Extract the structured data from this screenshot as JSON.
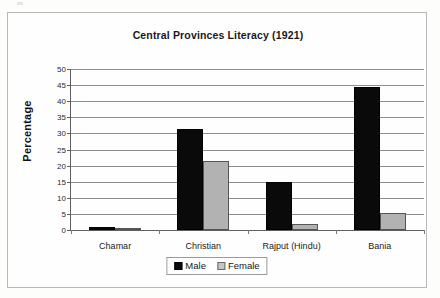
{
  "chart_data": {
    "type": "bar",
    "title": "Central Provinces Literacy (1921)",
    "xlabel": "",
    "ylabel": "Percentage",
    "categories": [
      "Chamar",
      "Christian",
      "Rajput (Hindu)",
      "Bania"
    ],
    "series": [
      {
        "name": "Male",
        "color": "#0a0a0a",
        "values": [
          1.0,
          31.5,
          15.0,
          44.5
        ]
      },
      {
        "name": "Female",
        "color": "#b2b2b2",
        "values": [
          0.2,
          21.5,
          2.0,
          5.4
        ]
      }
    ],
    "ylim": [
      0,
      50
    ],
    "ytick_labels": [
      "0",
      "5",
      "10",
      "15",
      "20",
      "25",
      "30",
      "35",
      "40",
      "45",
      "50"
    ],
    "ytick_values": [
      0,
      5,
      10,
      15,
      20,
      25,
      30,
      35,
      40,
      45,
      50
    ],
    "grid": true,
    "legend_position": "bottom-center"
  }
}
